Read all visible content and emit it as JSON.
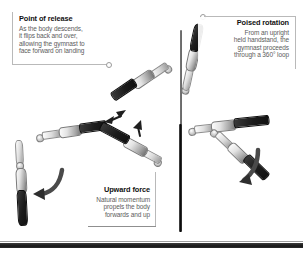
{
  "diagram": {
    "background_color": "#ffffff",
    "ink_color": "#111111",
    "body_text_color": "#5c5c5c",
    "rule_color": "#b9b9b9",
    "ground_bar_color": "#1a1a1a"
  },
  "callouts": [
    {
      "id": "point-of-release",
      "title": "Point of release",
      "lines": [
        "As the body descends,",
        "it flips back and over,",
        "allowing the gymnast to",
        "face forward on landing"
      ],
      "align": "left"
    },
    {
      "id": "poised-rotation",
      "title": "Poised rotation",
      "lines": [
        "From an upright",
        "held handstand, the",
        "gymnast proceeds",
        "through a 360° loop"
      ],
      "align": "right"
    },
    {
      "id": "upward-force",
      "title": "Upward force",
      "lines": [
        "Natural momentum",
        "propels the body",
        "forwards and up"
      ],
      "align": "right"
    }
  ],
  "figures": [
    {
      "id": "handstand-top",
      "label": "gymnast-handstand"
    },
    {
      "id": "loop-upper-left",
      "label": "gymnast-rotating"
    },
    {
      "id": "loop-left",
      "label": "gymnast-rotating"
    },
    {
      "id": "loop-lower-left",
      "label": "gymnast-rotating"
    },
    {
      "id": "loop-right-extended",
      "label": "gymnast-rotating"
    },
    {
      "id": "loop-lower-right",
      "label": "gymnast-descending"
    },
    {
      "id": "landing-figure",
      "label": "gymnast-landing"
    }
  ],
  "arrows": [
    {
      "id": "landing-direction-arrow",
      "style": "curved"
    },
    {
      "id": "descent-direction-arrow",
      "style": "curved"
    },
    {
      "id": "rotation-tick-arrow-1",
      "style": "short"
    },
    {
      "id": "rotation-tick-arrow-2",
      "style": "short"
    },
    {
      "id": "rotation-tick-arrow-3",
      "style": "short"
    }
  ],
  "elements": {
    "pole_label": "high-bar-pole",
    "ground_label": "floor-bar"
  }
}
